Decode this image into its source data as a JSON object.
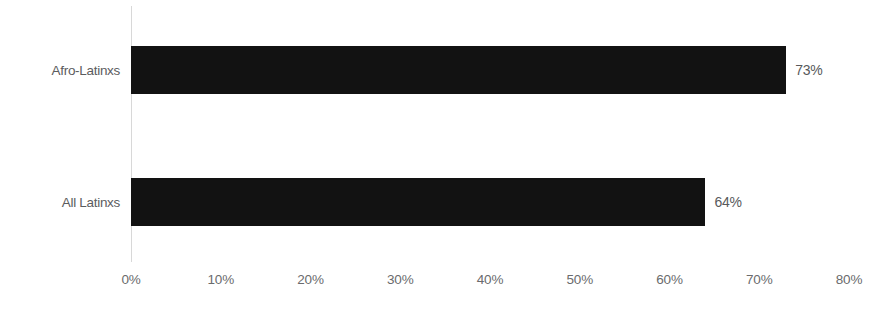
{
  "chart_data": {
    "type": "bar",
    "orientation": "horizontal",
    "title": "",
    "subtitle": "",
    "xlabel": "",
    "ylabel": "",
    "categories": [
      "Afro-Latinxs",
      "All Latinxs"
    ],
    "values": [
      73,
      64
    ],
    "value_labels": [
      "73%",
      "64%"
    ],
    "xlim": [
      0,
      80
    ],
    "tick_values": [
      0,
      10,
      20,
      30,
      40,
      50,
      60,
      70,
      80
    ],
    "tick_labels": [
      "0%",
      "10%",
      "20%",
      "30%",
      "40%",
      "50%",
      "60%",
      "70%",
      "80%"
    ],
    "grid": false,
    "legend": false,
    "legend_position": "none",
    "bar_color": "#121212",
    "axis_line_color": "#d8d8d8",
    "tick_label_color": "#6a6b6d",
    "category_label_color": "#5b5c5e",
    "value_label_color": "#58595b",
    "background_color": "#ffffff"
  }
}
